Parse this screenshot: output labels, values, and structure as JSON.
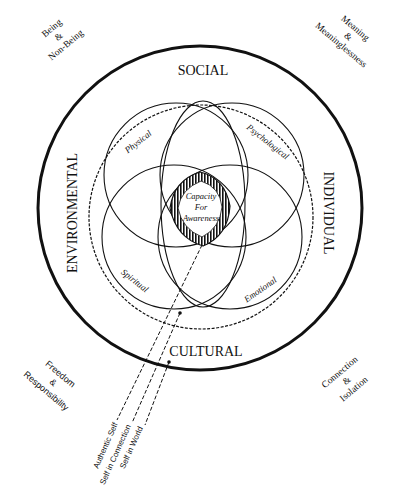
{
  "diagram": {
    "corners": {
      "top_left": {
        "line1": "Being",
        "line2": "&",
        "line3": "Non-Being"
      },
      "top_right": {
        "line1": "Meaning",
        "line2": "&",
        "line3": "Meaninglessness"
      },
      "bottom_left": {
        "line1": "Freedom",
        "line2": "&",
        "line3": "Responsibility"
      },
      "bottom_right": {
        "line1": "Connection",
        "line2": "&",
        "line3": "Isolation"
      }
    },
    "outer_ring": {
      "top": "SOCIAL",
      "right": "INDIVIDUAL",
      "bottom": "CULTURAL",
      "left": "ENVIRONMENTAL"
    },
    "circles": {
      "upper_left": "Physical",
      "upper_right": "Psychological",
      "lower_left": "Spiritual",
      "lower_right": "Emotional"
    },
    "center": {
      "line1": "Capacity",
      "line2": "For",
      "line3": "Awareness"
    },
    "self_lines": [
      "Authentic Self",
      "Self in Connection",
      "Self in World"
    ],
    "colors": {
      "ink": "#111111",
      "background": "#ffffff"
    }
  }
}
